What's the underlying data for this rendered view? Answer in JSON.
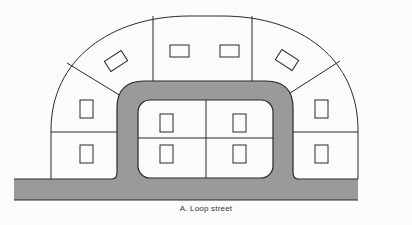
{
  "figure": {
    "caption": "A.  Loop street",
    "colors": {
      "background": "#fbfbfb",
      "road": "#9a9a9a",
      "lot_lines": "#2a2a2a",
      "lot_fill": "#fbfbfb"
    },
    "elements": {
      "main_road": "horizontal street along bottom",
      "loop_road": "U-shaped loop street",
      "outer_lots": 8,
      "inner_lots": 4,
      "houses": 12
    }
  }
}
